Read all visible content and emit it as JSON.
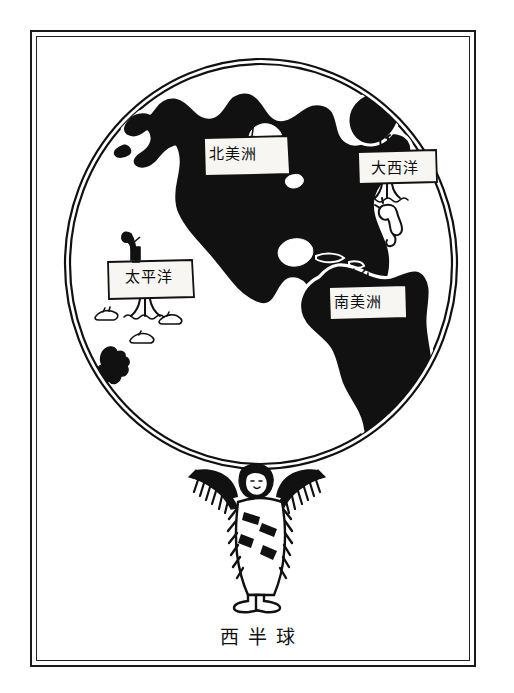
{
  "figure": {
    "caption": "西半球",
    "caption_meaning_icon": "globe-western-hemisphere",
    "frame_style": "double-rule-border",
    "ink_color": "#111111",
    "paper_color": "#ffffff"
  },
  "globe": {
    "name": "western-hemisphere-globe",
    "outline_color": "#111111",
    "land_fill": "#111111",
    "ocean_fill": "#ffffff"
  },
  "labels": [
    {
      "id": "north-america",
      "text": "北美洲",
      "kind": "continent",
      "sign_type": "placard-on-post"
    },
    {
      "id": "atlantic",
      "text": "大西洋",
      "kind": "ocean",
      "sign_type": "placard-on-post"
    },
    {
      "id": "pacific",
      "text": "太平洋",
      "kind": "ocean",
      "sign_type": "placard-on-post"
    },
    {
      "id": "south-america",
      "text": "南美洲",
      "kind": "continent",
      "sign_type": "placard-on-post"
    }
  ],
  "decorations": [
    {
      "id": "seahorse",
      "name": "seahorse-icon",
      "ocean": "大西洋"
    },
    {
      "id": "pacific-islands",
      "name": "island-cluster-icon",
      "ocean": "太平洋"
    },
    {
      "id": "lookout-figure",
      "name": "lookout-with-spyglass-icon",
      "ocean": "太平洋"
    },
    {
      "id": "atlas-figure",
      "name": "native-american-atlas-figure",
      "position": "beneath-globe"
    }
  ]
}
